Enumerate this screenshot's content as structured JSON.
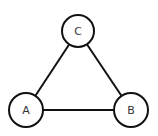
{
  "diagram": {
    "type": "graph",
    "colors": {
      "stroke": "#111111",
      "fill": "#ffffff",
      "label": "#333333"
    },
    "nodes": [
      {
        "id": "A",
        "label": "A",
        "cx": 26,
        "cy": 110,
        "r": 17
      },
      {
        "id": "B",
        "label": "B",
        "cx": 131,
        "cy": 110,
        "r": 17
      },
      {
        "id": "C",
        "label": "C",
        "cx": 78,
        "cy": 31,
        "r": 16
      }
    ],
    "edges": [
      {
        "from": "A",
        "to": "C"
      },
      {
        "from": "C",
        "to": "B"
      },
      {
        "from": "A",
        "to": "B"
      }
    ]
  }
}
